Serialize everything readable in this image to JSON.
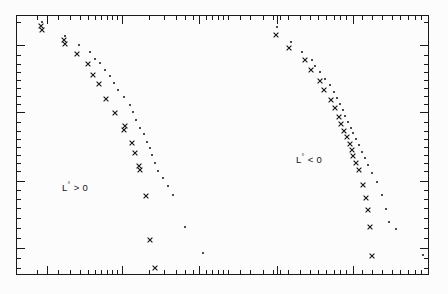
{
  "figure": {
    "background": "#fcfcfc",
    "frame_color": "#1a1a1a",
    "axis_labels_visible": false
  },
  "annotations": [
    {
      "id": "left-group-label",
      "text": "L° > 0",
      "x": 62,
      "y": 181
    },
    {
      "id": "right-group-label",
      "text": "L° < 0",
      "x": 296,
      "y": 153
    }
  ],
  "chart_data": {
    "type": "scatter",
    "title": "",
    "xlabel": "",
    "ylabel": "",
    "axis_scale": {
      "x": "log",
      "y": "log"
    },
    "grid": false,
    "legend": null,
    "tick_labels": {
      "x": [],
      "y": []
    },
    "note": "Two point clouds labelled L° > 0 (left) and L° < 0 (right); each cloud holds a cross series and a dot series. Coordinates are in pixel space of the 448x294 figure.",
    "series": [
      {
        "name": "L-positive-cross",
        "group": "L° > 0",
        "marker": "cross",
        "color": "#101010",
        "points": [
          [
            41,
            26
          ],
          [
            42,
            30
          ],
          [
            64,
            40
          ],
          [
            65,
            44
          ],
          [
            77,
            54
          ],
          [
            88,
            64
          ],
          [
            93,
            75
          ],
          [
            99,
            84
          ],
          [
            106,
            99
          ],
          [
            115,
            113
          ],
          [
            125,
            126
          ],
          [
            124,
            130
          ],
          [
            132,
            143
          ],
          [
            135,
            153
          ],
          [
            139,
            166
          ],
          [
            140,
            170
          ],
          [
            146,
            196
          ],
          [
            150,
            240
          ],
          [
            155,
            268
          ]
        ]
      },
      {
        "name": "L-positive-dot",
        "group": "L° > 0",
        "marker": "dot",
        "color": "#101010",
        "points": [
          [
            42,
            22
          ],
          [
            65,
            36
          ],
          [
            79,
            45
          ],
          [
            90,
            52
          ],
          [
            95,
            59
          ],
          [
            100,
            63
          ],
          [
            105,
            70
          ],
          [
            110,
            76
          ],
          [
            114,
            83
          ],
          [
            118,
            90
          ],
          [
            124,
            97
          ],
          [
            130,
            105
          ],
          [
            133,
            112
          ],
          [
            136,
            120
          ],
          [
            140,
            128
          ],
          [
            144,
            134
          ],
          [
            147,
            142
          ],
          [
            150,
            148
          ],
          [
            152,
            155
          ],
          [
            155,
            163
          ],
          [
            158,
            171
          ],
          [
            163,
            178
          ],
          [
            168,
            186
          ],
          [
            173,
            195
          ],
          [
            185,
            227
          ],
          [
            203,
            253
          ]
        ]
      },
      {
        "name": "L-negative-cross",
        "group": "L° < 0",
        "marker": "cross",
        "color": "#101010",
        "points": [
          [
            276,
            35
          ],
          [
            289,
            48
          ],
          [
            305,
            60
          ],
          [
            311,
            70
          ],
          [
            320,
            81
          ],
          [
            324,
            90
          ],
          [
            331,
            100
          ],
          [
            335,
            108
          ],
          [
            339,
            117
          ],
          [
            341,
            124
          ],
          [
            344,
            131
          ],
          [
            347,
            137
          ],
          [
            350,
            144
          ],
          [
            352,
            150
          ],
          [
            353,
            156
          ],
          [
            356,
            163
          ],
          [
            359,
            170
          ],
          [
            363,
            185
          ],
          [
            366,
            198
          ],
          [
            368,
            210
          ],
          [
            370,
            227
          ],
          [
            372,
            256
          ]
        ]
      },
      {
        "name": "L-negative-dot",
        "group": "L° < 0",
        "marker": "dot",
        "color": "#101010",
        "points": [
          [
            277,
            27
          ],
          [
            291,
            42
          ],
          [
            302,
            52
          ],
          [
            312,
            60
          ],
          [
            315,
            66
          ],
          [
            320,
            72
          ],
          [
            325,
            79
          ],
          [
            330,
            85
          ],
          [
            334,
            92
          ],
          [
            337,
            98
          ],
          [
            340,
            104
          ],
          [
            343,
            110
          ],
          [
            345,
            116
          ],
          [
            348,
            122
          ],
          [
            351,
            128
          ],
          [
            353,
            133
          ],
          [
            356,
            139
          ],
          [
            359,
            145
          ],
          [
            362,
            152
          ],
          [
            365,
            158
          ],
          [
            368,
            165
          ],
          [
            372,
            173
          ],
          [
            377,
            182
          ],
          [
            382,
            195
          ],
          [
            386,
            209
          ],
          [
            389,
            222
          ],
          [
            396,
            229
          ],
          [
            423,
            255
          ]
        ]
      }
    ],
    "axes_ticks": {
      "bottom_major": [
        47,
        122,
        199,
        277,
        353,
        428
      ],
      "bottom_minor": [
        37,
        58,
        70,
        80,
        88,
        95,
        101,
        107,
        112,
        117,
        149,
        164,
        176,
        185,
        193,
        206,
        212,
        218,
        223,
        228,
        240,
        250,
        263,
        273,
        280,
        288,
        300,
        310,
        318,
        326,
        334,
        340,
        346,
        362,
        372,
        382,
        392,
        400,
        408,
        415,
        421
      ],
      "top_major": [
        47,
        122,
        199,
        277,
        353,
        428
      ],
      "top_minor": [
        37,
        58,
        70,
        80,
        88,
        95,
        101,
        107,
        112,
        117,
        149,
        164,
        176,
        185,
        193,
        206,
        212,
        218,
        223,
        228,
        240,
        250,
        263,
        273,
        280,
        288,
        300,
        310,
        318,
        326,
        334,
        340,
        346,
        362,
        372,
        382,
        392,
        400,
        408,
        415,
        421
      ],
      "left_major": [
        45,
        112,
        181,
        248
      ],
      "left_minor": [
        22,
        55,
        64,
        72,
        80,
        88,
        96,
        104,
        122,
        131,
        139,
        147,
        155,
        163,
        171,
        190,
        199,
        208,
        218,
        228,
        238,
        258,
        268
      ],
      "right_major": [
        45,
        112,
        181,
        248
      ],
      "right_minor": [
        22,
        55,
        64,
        72,
        80,
        88,
        96,
        104,
        122,
        131,
        139,
        147,
        155,
        163,
        171,
        190,
        199,
        208,
        218,
        228,
        238,
        258,
        268
      ]
    }
  }
}
